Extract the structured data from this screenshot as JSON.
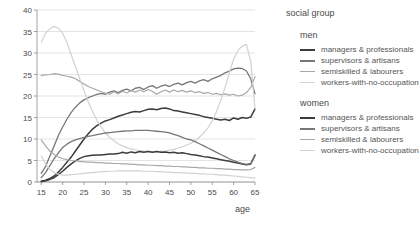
{
  "legend": {
    "title": "social group",
    "groups": [
      {
        "name": "men",
        "entries": [
          {
            "label": "managers & professionals",
            "color": "#3c3c3c",
            "width": 2.6
          },
          {
            "label": "supervisors & artisans",
            "color": "#777777",
            "width": 2.2
          },
          {
            "label": "semiskilled & labourers",
            "color": "#a8a8a8",
            "width": 1.8
          },
          {
            "label": "workers-with-no-occupation",
            "color": "#d2d2d2",
            "width": 1.4
          }
        ]
      },
      {
        "name": "women",
        "entries": [
          {
            "label": "managers & professionals",
            "color": "#3c3c3c",
            "width": 2.6
          },
          {
            "label": "supervisors & artisans",
            "color": "#777777",
            "width": 2.2
          },
          {
            "label": "semiskilled & labourers",
            "color": "#a8a8a8",
            "width": 1.8
          },
          {
            "label": "workers-with-no-occupation",
            "color": "#d2d2d2",
            "width": 1.4
          }
        ]
      }
    ]
  },
  "chart_data": {
    "type": "line",
    "title": "",
    "xlabel": "age",
    "ylabel": "",
    "xlim": [
      14,
      65
    ],
    "ylim": [
      0,
      40
    ],
    "xticks": [
      15,
      20,
      25,
      30,
      35,
      40,
      45,
      50,
      55,
      60,
      65
    ],
    "yticks": [
      0,
      5,
      10,
      15,
      20,
      25,
      30,
      35,
      40
    ],
    "grid": "horizontal",
    "legend_position": "right",
    "x": [
      15,
      16,
      17,
      18,
      19,
      20,
      21,
      22,
      23,
      24,
      25,
      26,
      27,
      28,
      29,
      30,
      31,
      32,
      33,
      34,
      35,
      36,
      37,
      38,
      39,
      40,
      41,
      42,
      43,
      44,
      45,
      46,
      47,
      48,
      49,
      50,
      51,
      52,
      53,
      54,
      55,
      56,
      57,
      58,
      59,
      60,
      61,
      62,
      63,
      64,
      65
    ],
    "series": [
      {
        "name": "men managers & professionals",
        "group": "men",
        "color": "#3c3c3c",
        "width": 1.5,
        "values": [
          0.2,
          0.4,
          0.8,
          1.4,
          2.3,
          3.4,
          4.6,
          5.8,
          7.2,
          8.6,
          10.0,
          11.2,
          12.3,
          13.1,
          13.7,
          14.2,
          14.5,
          14.9,
          15.3,
          15.6,
          15.9,
          16.2,
          16.4,
          16.3,
          16.6,
          16.9,
          17.0,
          16.8,
          17.1,
          17.2,
          17.0,
          16.6,
          16.5,
          16.3,
          16.1,
          15.9,
          15.7,
          15.5,
          15.2,
          15.0,
          14.8,
          14.6,
          14.4,
          14.6,
          14.3,
          14.9,
          14.6,
          15.0,
          14.8,
          15.1,
          17.0
        ]
      },
      {
        "name": "men supervisors & artisans",
        "group": "men",
        "color": "#777777",
        "width": 1.3,
        "values": [
          2.0,
          3.6,
          6.0,
          8.4,
          10.8,
          12.8,
          14.6,
          16.2,
          17.4,
          18.4,
          19.1,
          19.6,
          20.0,
          20.4,
          20.6,
          20.4,
          20.9,
          21.2,
          20.8,
          21.3,
          21.6,
          21.2,
          21.8,
          22.0,
          21.5,
          22.1,
          22.4,
          21.8,
          22.3,
          22.6,
          22.2,
          22.7,
          23.0,
          22.6,
          23.1,
          23.4,
          23.0,
          23.5,
          23.8,
          23.4,
          24.0,
          24.4,
          24.8,
          25.4,
          25.8,
          26.3,
          26.5,
          26.4,
          25.8,
          24.0,
          20.5
        ]
      },
      {
        "name": "men semiskilled & labourers",
        "group": "men",
        "color": "#a8a8a8",
        "width": 1.2,
        "values": [
          24.8,
          24.9,
          25.0,
          25.2,
          25.1,
          24.8,
          24.6,
          24.4,
          24.0,
          23.4,
          22.8,
          22.2,
          21.8,
          21.4,
          21.0,
          20.7,
          20.4,
          21.0,
          20.5,
          21.1,
          20.7,
          21.3,
          20.9,
          21.4,
          21.0,
          21.5,
          21.1,
          20.4,
          21.0,
          21.4,
          20.9,
          21.4,
          21.0,
          21.3,
          20.9,
          21.2,
          20.8,
          21.0,
          20.6,
          20.8,
          20.4,
          20.6,
          20.3,
          20.5,
          20.2,
          20.4,
          20.0,
          20.2,
          20.8,
          22.0,
          24.5
        ]
      },
      {
        "name": "men workers-with-no-occupation",
        "group": "men",
        "color": "#d2d2d2",
        "width": 1.2,
        "values": [
          32.5,
          34.6,
          35.6,
          36.2,
          35.8,
          34.6,
          32.4,
          29.6,
          26.8,
          24.0,
          21.2,
          18.6,
          16.4,
          14.4,
          12.8,
          11.4,
          10.4,
          9.6,
          8.9,
          8.4,
          8.0,
          7.7,
          7.5,
          7.3,
          7.2,
          7.1,
          7.0,
          7.0,
          7.1,
          7.2,
          7.4,
          7.6,
          7.9,
          8.2,
          8.6,
          9.0,
          9.6,
          10.4,
          11.4,
          12.6,
          14.2,
          16.4,
          19.0,
          22.0,
          25.4,
          28.6,
          30.6,
          31.6,
          32.0,
          28.0,
          17.0
        ]
      },
      {
        "name": "women managers & professionals",
        "group": "women",
        "color": "#3c3c3c",
        "width": 1.5,
        "values": [
          0.1,
          0.3,
          0.6,
          1.0,
          1.7,
          2.5,
          3.4,
          4.2,
          4.9,
          5.5,
          5.9,
          6.1,
          6.2,
          6.3,
          6.3,
          6.4,
          6.5,
          6.5,
          6.6,
          6.9,
          6.7,
          7.0,
          6.8,
          7.1,
          6.9,
          7.1,
          6.9,
          7.1,
          6.9,
          7.0,
          6.8,
          6.9,
          6.7,
          6.8,
          6.6,
          6.4,
          6.3,
          6.1,
          5.9,
          5.8,
          5.6,
          5.4,
          5.2,
          5.0,
          4.8,
          4.6,
          4.4,
          4.2,
          4.0,
          4.2,
          6.2
        ]
      },
      {
        "name": "women supervisors & artisans",
        "group": "women",
        "color": "#777777",
        "width": 1.3,
        "values": [
          1.0,
          2.2,
          3.8,
          5.4,
          6.8,
          8.0,
          8.8,
          9.4,
          9.8,
          10.1,
          10.4,
          10.6,
          10.8,
          11.0,
          11.2,
          11.4,
          11.5,
          11.6,
          11.7,
          11.8,
          11.9,
          11.9,
          12.0,
          12.0,
          12.0,
          12.0,
          11.9,
          11.8,
          11.7,
          11.6,
          11.4,
          11.1,
          10.8,
          10.4,
          10.0,
          9.8,
          9.4,
          8.9,
          8.4,
          7.9,
          7.4,
          6.9,
          6.4,
          5.9,
          5.4,
          5.0,
          4.6,
          4.3,
          4.1,
          4.3,
          6.4
        ]
      },
      {
        "name": "women semiskilled & labourers",
        "group": "women",
        "color": "#a8a8a8",
        "width": 1.2,
        "values": [
          9.8,
          8.4,
          7.2,
          6.4,
          5.8,
          5.4,
          5.2,
          5.0,
          4.9,
          4.8,
          4.7,
          4.6,
          4.6,
          4.5,
          4.5,
          4.4,
          4.4,
          4.3,
          4.3,
          4.2,
          4.2,
          4.1,
          4.1,
          4.0,
          4.0,
          3.9,
          3.9,
          3.8,
          3.8,
          3.7,
          3.7,
          3.6,
          3.6,
          3.5,
          3.5,
          3.4,
          3.4,
          3.3,
          3.3,
          3.2,
          3.2,
          3.1,
          3.1,
          3.0,
          3.0,
          2.9,
          2.9,
          2.8,
          2.8,
          2.9,
          3.4
        ]
      },
      {
        "name": "women workers-with-no-occupation",
        "group": "women",
        "color": "#d2d2d2",
        "width": 1.2,
        "values": [
          6.0,
          4.2,
          3.0,
          2.2,
          1.8,
          1.6,
          1.6,
          1.7,
          1.8,
          1.9,
          2.0,
          2.1,
          2.2,
          2.3,
          2.4,
          2.4,
          2.5,
          2.5,
          2.6,
          2.6,
          2.6,
          2.6,
          2.6,
          2.6,
          2.5,
          2.5,
          2.5,
          2.4,
          2.4,
          2.3,
          2.3,
          2.2,
          2.2,
          2.1,
          2.1,
          2.0,
          2.0,
          1.9,
          1.9,
          1.8,
          1.8,
          1.7,
          1.6,
          1.6,
          1.5,
          1.4,
          1.3,
          1.2,
          1.1,
          1.0,
          0.9
        ]
      }
    ]
  }
}
